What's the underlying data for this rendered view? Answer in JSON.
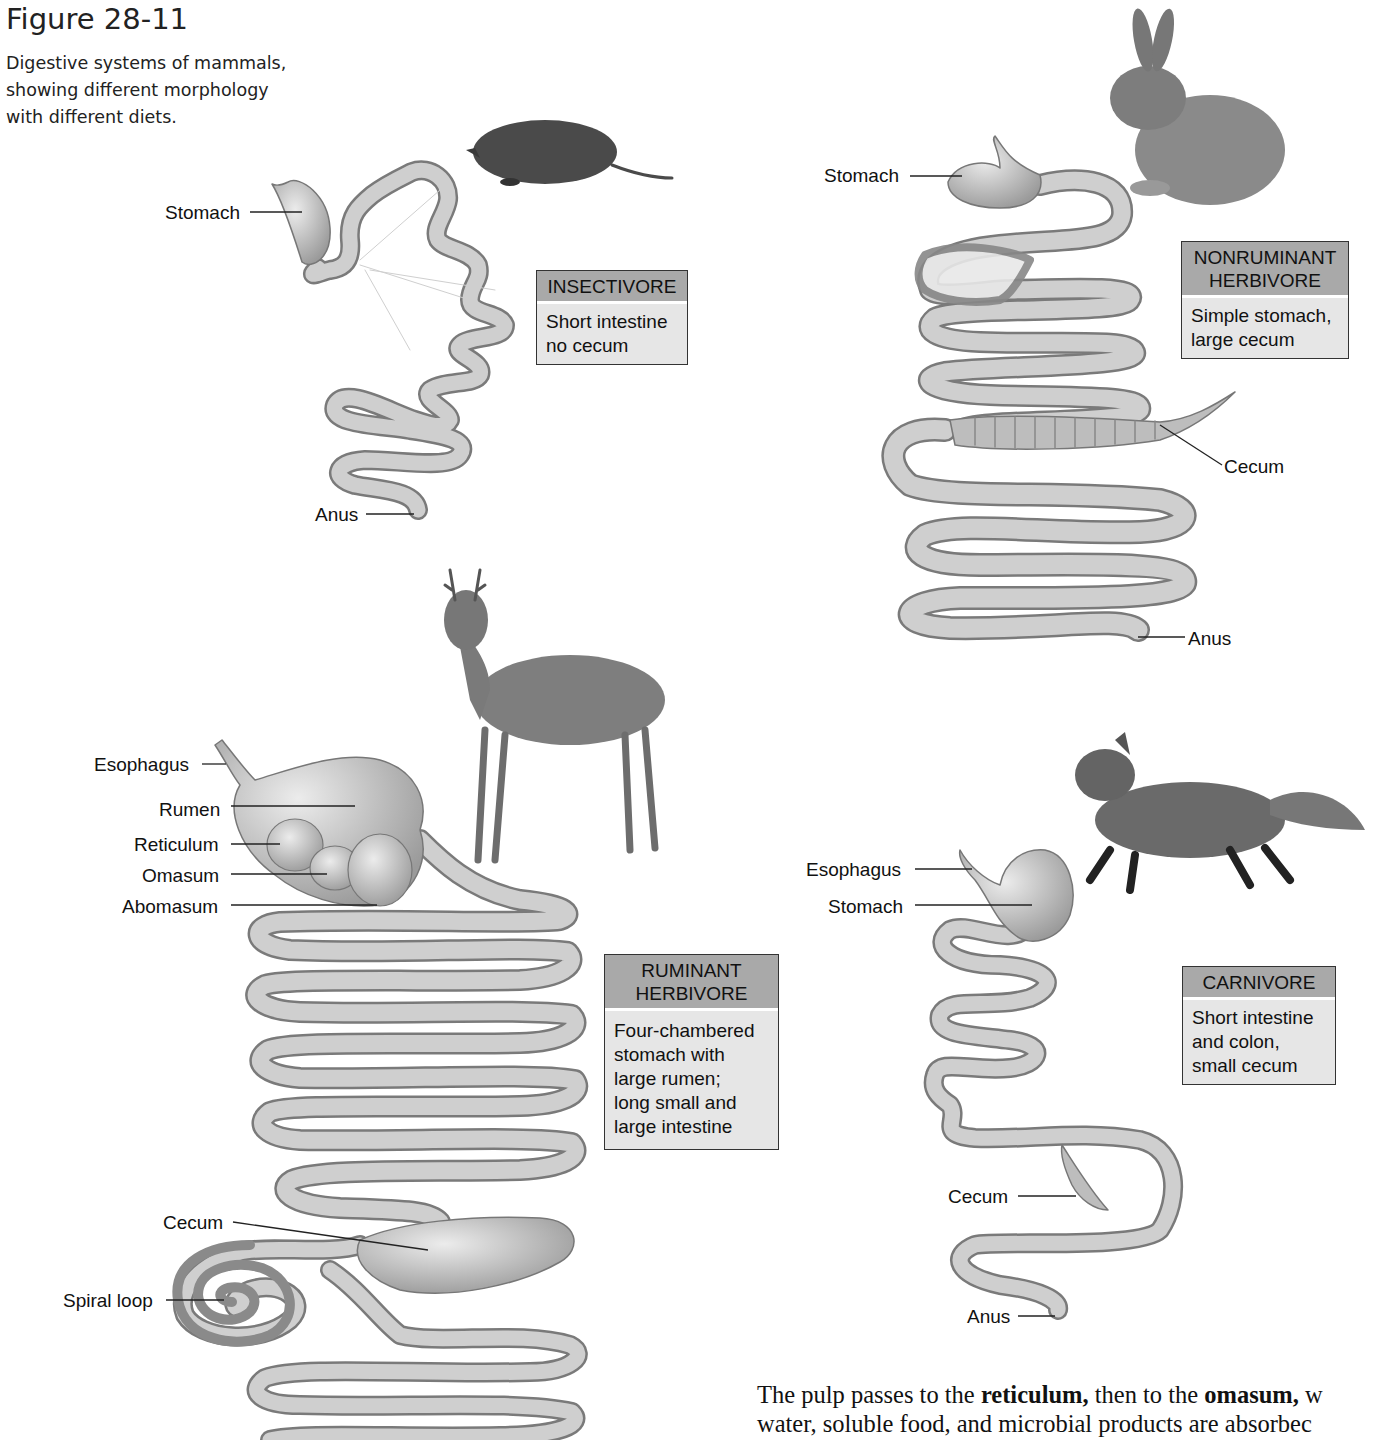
{
  "figure": {
    "number": "Figure 28-11",
    "caption_lines": [
      "Digestive systems of mammals,",
      "showing different morphology",
      "with different diets."
    ]
  },
  "panels": {
    "insectivore": {
      "animal_icon": "mole-icon",
      "box": {
        "title": "INSECTIVORE",
        "lines": [
          "Short intestine",
          "no cecum"
        ]
      },
      "labels": {
        "stomach": "Stomach",
        "anus": "Anus"
      }
    },
    "nonruminant": {
      "animal_icon": "rabbit-icon",
      "box": {
        "title_lines": [
          "NONRUMINANT",
          "HERBIVORE"
        ],
        "lines": [
          "Simple stomach,",
          "large cecum"
        ]
      },
      "labels": {
        "stomach": "Stomach",
        "cecum": "Cecum",
        "anus": "Anus"
      }
    },
    "ruminant": {
      "animal_icon": "deer-icon",
      "box": {
        "title_lines": [
          "RUMINANT",
          "HERBIVORE"
        ],
        "lines": [
          "Four-chambered",
          "stomach with",
          "large rumen;",
          "long small and",
          "large intestine"
        ]
      },
      "labels": {
        "esophagus": "Esophagus",
        "rumen": "Rumen",
        "reticulum": "Reticulum",
        "omasum": "Omasum",
        "abomasum": "Abomasum",
        "cecum": "Cecum",
        "spiral_loop": "Spiral loop"
      }
    },
    "carnivore": {
      "animal_icon": "fox-icon",
      "box": {
        "title": "CARNIVORE",
        "lines": [
          "Short intestine",
          "and colon,",
          "small cecum"
        ]
      },
      "labels": {
        "esophagus": "Esophagus",
        "stomach": "Stomach",
        "cecum": "Cecum",
        "anus": "Anus"
      }
    }
  },
  "body_text": {
    "line1_a": "The pulp passes to the ",
    "line1_b": "reticulum,",
    "line1_c": " then to the ",
    "line1_d": "omasum,",
    "line1_e": " w",
    "line2": "water, soluble food, and microbial products are absorbec"
  },
  "colors": {
    "box_header": "#a9a9a9",
    "box_body": "#e6e6e6",
    "gut": "#c9c9c9",
    "gut_stroke": "#7a7a7a"
  }
}
